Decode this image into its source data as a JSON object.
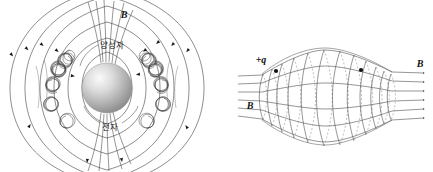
{
  "figure": {
    "background_color": "#ffffff",
    "line_color": "#3a3a3a",
    "caption": ""
  },
  "left_panel": {
    "name": "earth-magnetosphere-diagram",
    "field_label": "B",
    "proton_label": "양성자",
    "electron_label": "전자",
    "sphere": {
      "name": "earth-sphere",
      "fill_light": "#f2f2f2",
      "fill_mid": "#bdbdbd",
      "fill_dark": "#8a8a8a",
      "cx": 107,
      "cy": 88,
      "r": 25
    },
    "dipole_field_lines": 9,
    "helix_belts": 2,
    "arrow_count": 16
  },
  "right_panel": {
    "name": "magnetic-bottle-diagram",
    "charge_label": "+q",
    "field_label_right": "B",
    "field_label_left": "B",
    "field_line_count": 6,
    "ring_count": 13,
    "particle_markers": 2,
    "marker_color": "#111111"
  }
}
